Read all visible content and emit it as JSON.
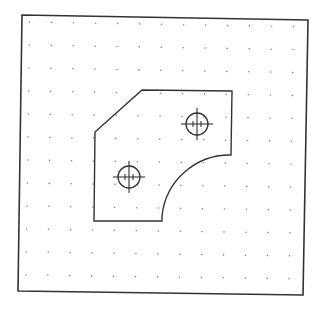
{
  "drawing": {
    "background": "#ffffff",
    "stroke_color": "#333333",
    "grid_dot_color": "#888888",
    "frame": {
      "corners": [
        [
          22,
          15
        ],
        [
          308,
          20
        ],
        [
          303,
          295
        ],
        [
          18,
          291
        ]
      ]
    },
    "grid": {
      "cols": 13,
      "rows": 12,
      "spacing": 22.2
    },
    "part_outline": {
      "points": [
        [
          142,
          90
        ],
        [
          232,
          91
        ],
        [
          231,
          155
        ]
      ],
      "arc": {
        "from": [
          231,
          155
        ],
        "to": [
          162,
          216
        ],
        "radius": 68
      },
      "points_after_arc": [
        [
          162,
          221
        ],
        [
          94,
          221
        ],
        [
          95,
          132
        ]
      ]
    },
    "holes": [
      {
        "name": "upper-hole",
        "cx": 197,
        "cy": 124,
        "r": 11,
        "cross": 16
      },
      {
        "name": "lower-hole",
        "cx": 129,
        "cy": 177,
        "r": 11,
        "cross": 16
      }
    ]
  }
}
